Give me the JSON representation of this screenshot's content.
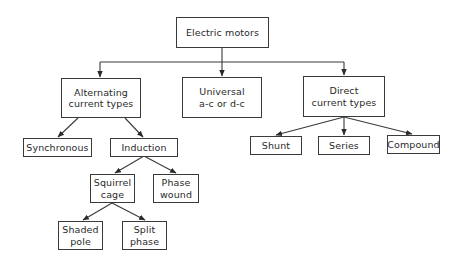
{
  "diagram": {
    "type": "tree",
    "root": {
      "id": "electric-motors",
      "lines": [
        "Electric motors"
      ]
    },
    "nodes": {
      "electric-motors": {
        "lines": [
          "Electric motors"
        ]
      },
      "alternating": {
        "lines": [
          "Alternating",
          "current types"
        ]
      },
      "universal": {
        "lines": [
          "Universal",
          "a-c or d-c"
        ]
      },
      "direct": {
        "lines": [
          "Direct",
          "current types"
        ]
      },
      "synchronous": {
        "lines": [
          "Synchronous"
        ]
      },
      "induction": {
        "lines": [
          "Induction"
        ]
      },
      "squirrel-cage": {
        "lines": [
          "Squirrel",
          "cage"
        ]
      },
      "phase-wound": {
        "lines": [
          "Phase",
          "wound"
        ]
      },
      "shaded-pole": {
        "lines": [
          "Shaded",
          "pole"
        ]
      },
      "split-phase": {
        "lines": [
          "Split",
          "phase"
        ]
      },
      "shunt": {
        "lines": [
          "Shunt"
        ]
      },
      "series": {
        "lines": [
          "Series"
        ]
      },
      "compound": {
        "lines": [
          "Compound"
        ]
      }
    },
    "edges": [
      [
        "electric-motors",
        "alternating"
      ],
      [
        "electric-motors",
        "universal"
      ],
      [
        "electric-motors",
        "direct"
      ],
      [
        "alternating",
        "synchronous"
      ],
      [
        "alternating",
        "induction"
      ],
      [
        "induction",
        "squirrel-cage"
      ],
      [
        "induction",
        "phase-wound"
      ],
      [
        "squirrel-cage",
        "shaded-pole"
      ],
      [
        "squirrel-cage",
        "split-phase"
      ],
      [
        "direct",
        "shunt"
      ],
      [
        "direct",
        "series"
      ],
      [
        "direct",
        "compound"
      ]
    ],
    "line_color": "#3a3a3a"
  }
}
